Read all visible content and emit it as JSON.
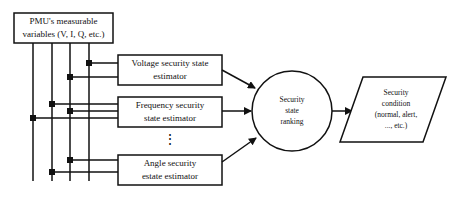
{
  "diagram": {
    "source_box": {
      "lines": [
        "PMU's measurable",
        "variables (V, I, Q, etc.)"
      ]
    },
    "estimators": [
      {
        "id": "voltage",
        "lines": [
          "Voltage security state",
          "estimator"
        ]
      },
      {
        "id": "frequency",
        "lines": [
          "Frequency security",
          "state estimator"
        ]
      },
      {
        "id": "angle",
        "lines": [
          "Angle security",
          "estate estimator"
        ]
      }
    ],
    "ellipsis": "⋮",
    "ranking": {
      "lines": [
        "Security",
        "state",
        "ranking"
      ]
    },
    "output": {
      "lines": [
        "Security",
        "condition",
        "(normal, alert,",
        "..., etc.)"
      ]
    },
    "colors": {
      "stroke": "#111111",
      "background": "#ffffff"
    }
  }
}
